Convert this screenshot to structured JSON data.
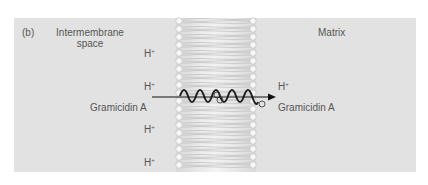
{
  "figure": {
    "panel_label": "(b)",
    "left_region": {
      "line1": "Intermembrane",
      "line2": "space"
    },
    "right_region": {
      "label": "Matrix"
    },
    "proton": {
      "base": "H",
      "charge": "+"
    },
    "left_protons_y": [
      46,
      79,
      122,
      155
    ],
    "right_proton_y": 79,
    "channel_label_left": "Gramicidin A",
    "channel_label_right": "Gramicidin A",
    "colors": {
      "panel_bg": "#e2e2e2",
      "text": "#555555",
      "membrane_head": "#f4f4f4",
      "membrane_tail": "#cfcfcf",
      "helix": "#222222",
      "arrow": "#111111"
    }
  }
}
